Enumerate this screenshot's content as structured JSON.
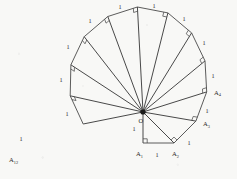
{
  "figure": {
    "kind": "geometry-diagram",
    "name": "Spiral of Theodorus",
    "background_color": "#f8f8f6",
    "line_color": "#4a4a4a",
    "label_color": "#2a2a2a",
    "hub_color": "#1c1c1c",
    "center": {
      "label": "O",
      "x": 143.0,
      "y": 112.0
    },
    "unit_length": 31.0,
    "start_angle_deg": 90,
    "triangle_count": 12,
    "right_angle_mark_size": 4.2,
    "unit_leg_label": "1",
    "vertices": [
      {
        "name": "A",
        "sub": "1",
        "x": 143.0,
        "y": 143.0,
        "label_dx": -7.0,
        "label_dy": 11.0
      },
      {
        "name": "A",
        "sub": "2",
        "x": 174.0,
        "y": 143.0,
        "label_dx": -2.0,
        "label_dy": 11.0
      },
      {
        "name": "A",
        "sub": "3",
        "x": 195.9,
        "y": 121.1,
        "label_dx": 6.0,
        "label_dy": 4.0
      },
      {
        "name": "A",
        "sub": "4",
        "x": 206.7,
        "y": 91.9,
        "label_dx": 6.5,
        "label_dy": 2.0
      },
      {
        "name": "A",
        "sub": "5",
        "x": 205.0,
        "y": 60.9,
        "label_dx": 6.5,
        "label_dy": 1.0
      },
      {
        "name": "A",
        "sub": "6",
        "x": 191.6,
        "y": 32.9,
        "label_dx": 5.5,
        "label_dy": -2.0
      },
      {
        "name": "A",
        "sub": "7",
        "x": 167.9,
        "y": 12.9,
        "label_dx": 3.0,
        "label_dy": -4.0
      },
      {
        "name": "A",
        "sub": "8",
        "x": 137.4,
        "y": 7.0,
        "label_dx": -1.0,
        "label_dy": -5.0
      },
      {
        "name": "A",
        "sub": "9",
        "x": 107.8,
        "y": 16.5,
        "label_dx": -7.0,
        "label_dy": -4.0
      },
      {
        "name": "A",
        "sub": "10",
        "x": 84.2,
        "y": 36.7,
        "label_dx": -11.0,
        "label_dy": -2.0
      },
      {
        "name": "A",
        "sub": "11",
        "x": 70.9,
        "y": 64.8,
        "label_dx": -12.0,
        "label_dy": 2.0
      },
      {
        "name": "A",
        "sub": "12",
        "x": 70.2,
        "y": 95.8,
        "label_dx": -12.5,
        "label_dy": 4.0
      },
      {
        "name": "A",
        "sub": "13",
        "x": 83.2,
        "y": 124.0,
        "label_dx": -12.0,
        "label_dy": 7.0
      }
    ],
    "visible_vertex_labels": [
      {
        "text": "A",
        "sub": "1",
        "x": 136.0,
        "y": 156.0
      },
      {
        "text": "A",
        "sub": "2",
        "x": 172.0,
        "y": 156.0
      },
      {
        "text": "A",
        "sub": "3",
        "x": 203.0,
        "y": 126.0
      },
      {
        "text": "A",
        "sub": "4",
        "x": 214.0,
        "y": 94.5
      },
      {
        "text": "A",
        "sub": "12",
        "x": 9.0,
        "y": 162.0
      }
    ],
    "center_label": {
      "text": "O",
      "x": 138.5,
      "y": 123.0
    },
    "unit_labels": [
      {
        "text": "1",
        "x": 134.0,
        "y": 131.0
      },
      {
        "text": "1",
        "x": 157.0,
        "y": 157.0
      },
      {
        "text": "1",
        "x": 189.0,
        "y": 145.0
      },
      {
        "text": "1",
        "x": 207.0,
        "y": 113.0
      },
      {
        "text": "1",
        "x": 213.0,
        "y": 78.0
      },
      {
        "text": "1",
        "x": 204.0,
        "y": 45.0
      },
      {
        "text": "1",
        "x": 184.0,
        "y": 21.0
      },
      {
        "text": "1",
        "x": 154.0,
        "y": 7.5
      },
      {
        "text": "1",
        "x": 120.0,
        "y": 8.5
      },
      {
        "text": "1",
        "x": 90.0,
        "y": 23.0
      },
      {
        "text": "1",
        "x": 68.0,
        "y": 49.0
      },
      {
        "text": "1",
        "x": 61.0,
        "y": 82.0
      },
      {
        "text": "1",
        "x": 67.0,
        "y": 116.0
      },
      {
        "text": "1",
        "x": 21.0,
        "y": 141.0
      }
    ]
  }
}
